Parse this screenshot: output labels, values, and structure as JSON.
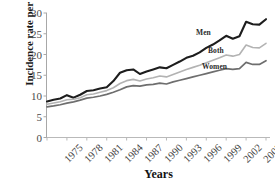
{
  "chart_data": {
    "type": "line",
    "title": "",
    "xlabel": "Years",
    "ylabel": "Incidence rate per 100,000",
    "xlim": [
      1975,
      2008
    ],
    "ylim": [
      0,
      30
    ],
    "ytick_labels": [
      "0",
      "5",
      "10",
      "15",
      "20",
      "25",
      "30"
    ],
    "ytick_values": [
      0,
      5,
      10,
      15,
      20,
      25,
      30
    ],
    "xtick_labels": [
      "1975",
      "1978",
      "1981",
      "1984",
      "1987",
      "1990",
      "1993",
      "1996",
      "1999",
      "2002",
      "2005",
      "2008"
    ],
    "xtick_values": [
      1975,
      1978,
      1981,
      1984,
      1987,
      1990,
      1993,
      1996,
      1999,
      2002,
      2005,
      2008
    ],
    "grid": false,
    "legend_position": "inline-right",
    "x": [
      1975,
      1976,
      1977,
      1978,
      1979,
      1980,
      1981,
      1982,
      1983,
      1984,
      1985,
      1986,
      1987,
      1988,
      1989,
      1990,
      1991,
      1992,
      1993,
      1994,
      1995,
      1996,
      1997,
      1998,
      1999,
      2000,
      2001,
      2002,
      2003,
      2004,
      2005,
      2006,
      2007,
      2008
    ],
    "series": [
      {
        "name": "Men",
        "color": "#1d1d1d",
        "width": 2.1,
        "label_x": 196,
        "label_y": 28,
        "values": [
          8.7,
          9.1,
          9.4,
          10.2,
          9.6,
          10.3,
          11.2,
          11.4,
          11.8,
          12.1,
          13.6,
          15.6,
          16.2,
          16.4,
          15.3,
          15.9,
          16.4,
          16.9,
          16.7,
          17.5,
          18.3,
          19.2,
          19.7,
          20.5,
          21.6,
          22.4,
          23.4,
          24.5,
          23.8,
          24.4,
          27.9,
          27.3,
          27.2,
          28.5
        ]
      },
      {
        "name": "Both",
        "color": "#b3b3b3",
        "width": 1.6,
        "label_x": 208,
        "label_y": 46,
        "values": [
          8.0,
          8.3,
          8.6,
          9.1,
          9.2,
          9.6,
          10.3,
          10.5,
          10.9,
          11.3,
          12.0,
          13.0,
          13.7,
          14.0,
          13.6,
          14.1,
          14.4,
          14.8,
          14.6,
          15.2,
          15.8,
          16.4,
          16.9,
          17.4,
          18.0,
          18.6,
          19.2,
          19.9,
          19.6,
          20.0,
          22.3,
          21.7,
          21.6,
          22.7
        ]
      },
      {
        "name": "Women",
        "color": "#6e6e6e",
        "width": 1.7,
        "label_x": 202,
        "label_y": 62,
        "values": [
          7.4,
          7.6,
          7.9,
          8.3,
          8.6,
          9.0,
          9.5,
          9.7,
          10.0,
          10.4,
          10.9,
          11.5,
          12.2,
          12.5,
          12.4,
          12.7,
          12.8,
          13.1,
          12.9,
          13.4,
          13.8,
          14.2,
          14.6,
          15.0,
          15.4,
          15.8,
          16.2,
          16.6,
          16.4,
          16.6,
          18.1,
          17.6,
          17.6,
          18.5
        ]
      }
    ]
  }
}
